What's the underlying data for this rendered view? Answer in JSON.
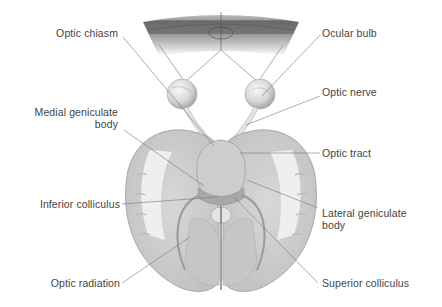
{
  "diagram": {
    "labels": {
      "optic_chiasm": "Optic chiasm",
      "ocular_bulb": "Ocular bulb",
      "optic_nerve": "Optic nerve",
      "medial_geniculate_line1": "Medial geniculate",
      "medial_geniculate_line2": "body",
      "optic_tract": "Optic tract",
      "inferior_colliculus": "Inferior colliculus",
      "lateral_geniculate_line1": "Lateral geniculate",
      "lateral_geniculate_line2": "body",
      "optic_radiation": "Optic radiation",
      "superior_colliculus": "Superior colliculus"
    },
    "colors": {
      "label_text": "#444444",
      "leader_line": "#777777",
      "brain_fill": "#d4d4d4",
      "white_matter": "#ececec",
      "visual_field_dark": "#6e6e6e",
      "visual_field_light": "#b4b4b4"
    }
  }
}
